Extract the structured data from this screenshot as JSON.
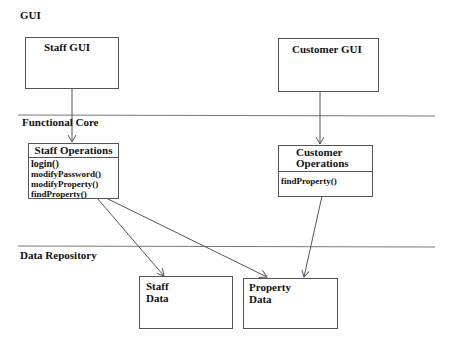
{
  "layers": [
    {
      "id": "gui",
      "label": "GUI"
    },
    {
      "id": "functional-core",
      "label": "Functional Core"
    },
    {
      "id": "data-repository",
      "label": "Data Repository"
    }
  ],
  "boxes": {
    "staff_gui": {
      "title": "Staff GUI"
    },
    "customer_gui": {
      "title": "Customer GUI"
    },
    "staff_operations": {
      "title": "Staff Operations",
      "methods": [
        "login()",
        "modifyPassword()",
        "modifyProperty()",
        "findProperty()"
      ]
    },
    "customer_operations": {
      "title_line1": "Customer",
      "title_line2": "Operations",
      "methods": [
        "findProperty()"
      ]
    },
    "staff_data": {
      "title_line1": "Staff",
      "title_line2": "Data"
    },
    "property_data": {
      "title_line1": "Property",
      "title_line2": "Data"
    }
  },
  "arrows": [
    {
      "from": "Staff GUI",
      "to": "Staff Operations"
    },
    {
      "from": "Customer GUI",
      "to": "Customer Operations"
    },
    {
      "from": "Staff Operations",
      "to": "Staff Data"
    },
    {
      "from": "Staff Operations",
      "to": "Property Data"
    },
    {
      "from": "Customer Operations",
      "to": "Property Data"
    }
  ],
  "colors": {
    "line": "#555555",
    "text": "#111111",
    "background": "#ffffff"
  }
}
